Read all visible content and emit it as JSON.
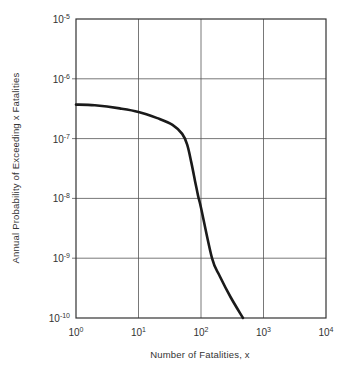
{
  "chart_data": {
    "type": "line",
    "title": "",
    "xlabel": "Number of Fatalities, x",
    "ylabel": "Annual Probability of Exceeding x Fatalities",
    "xscale": "log",
    "yscale": "log",
    "xlim": [
      1,
      10000
    ],
    "ylim": [
      1e-10,
      1e-05
    ],
    "grid": true,
    "legend": null,
    "x_ticks": [
      {
        "base": "10",
        "exp": "0"
      },
      {
        "base": "10",
        "exp": "1"
      },
      {
        "base": "10",
        "exp": "2"
      },
      {
        "base": "10",
        "exp": "3"
      },
      {
        "base": "10",
        "exp": "4"
      }
    ],
    "y_ticks": [
      {
        "base": "10",
        "exp": "-5"
      },
      {
        "base": "10",
        "exp": "-6"
      },
      {
        "base": "10",
        "exp": "-7"
      },
      {
        "base": "10",
        "exp": "-8"
      },
      {
        "base": "10",
        "exp": "-9"
      },
      {
        "base": "10",
        "exp": "-10"
      }
    ],
    "series": [
      {
        "name": "Fatality exceedance curve",
        "color": "#1a1a1a",
        "x": [
          1,
          2,
          5,
          10,
          20,
          35,
          50,
          60,
          70,
          80,
          90,
          100,
          150,
          200,
          300,
          470
        ],
        "y": [
          3.7e-07,
          3.6e-07,
          3.2e-07,
          2.8e-07,
          2.2e-07,
          1.7e-07,
          1.2e-07,
          8e-08,
          4e-08,
          2e-08,
          1.1e-08,
          7e-09,
          1e-09,
          5e-10,
          2.2e-10,
          1e-10
        ]
      }
    ]
  }
}
